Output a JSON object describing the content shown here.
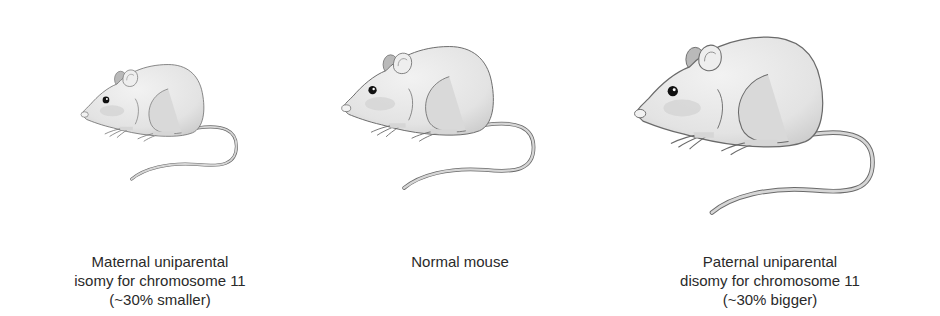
{
  "panels": [
    {
      "id": "maternal",
      "caption_lines": [
        "Maternal uniparental",
        "isomy for chromosome 11",
        "(~30% smaller)"
      ],
      "relative_size": "~30% smaller"
    },
    {
      "id": "normal",
      "caption_lines": [
        "Normal mouse"
      ],
      "relative_size": "normal"
    },
    {
      "id": "paternal",
      "caption_lines": [
        "Paternal uniparental",
        "disomy for chromosome 11",
        "(~30% bigger)"
      ],
      "relative_size": "~30% bigger"
    }
  ],
  "colors": {
    "body_fill": "#e6e6e6",
    "shade": "#cfcfcf",
    "outline": "#6a6a6a",
    "text": "#2a2a2a"
  }
}
